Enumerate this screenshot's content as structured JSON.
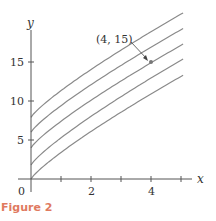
{
  "figure": {
    "caption": "Figure 2"
  },
  "chart_data": {
    "type": "line",
    "title": "",
    "xlabel": "x",
    "ylabel": "y",
    "xlim": [
      0,
      5.1
    ],
    "ylim": [
      0,
      20
    ],
    "x_ticks": [
      1,
      2,
      3,
      4,
      5
    ],
    "x_tick_labels": [
      "",
      "2",
      "",
      "4",
      ""
    ],
    "y_ticks": [
      5,
      10,
      15
    ],
    "y_tick_labels": [
      "5",
      "10",
      "15"
    ],
    "origin_label": "0",
    "grid": false,
    "legend": null,
    "series": [
      {
        "name": "curve-1",
        "y_intercept": 0.0,
        "end": [
          5.07,
          13.3
        ]
      },
      {
        "name": "curve-2",
        "y_intercept": 1.8,
        "end": [
          5.07,
          15.4
        ]
      },
      {
        "name": "curve-3",
        "y_intercept": 4.0,
        "end": [
          5.07,
          17.3
        ]
      },
      {
        "name": "curve-4",
        "y_intercept": 6.0,
        "end": [
          5.07,
          19.3
        ]
      },
      {
        "name": "curve-5",
        "y_intercept": 7.9,
        "end": [
          5.07,
          21.3
        ]
      }
    ],
    "curve_shape": {
      "form": "y = C + a*x^p",
      "a": 3.0,
      "p": 0.84
    },
    "annotations": [
      {
        "text": "(4, 15)",
        "point": [
          4,
          15
        ],
        "arrow": true
      }
    ],
    "colors": {
      "curves": "#8a8a8a",
      "axes": "#555555",
      "point": "#777777",
      "caption": "#e07a5f"
    }
  }
}
